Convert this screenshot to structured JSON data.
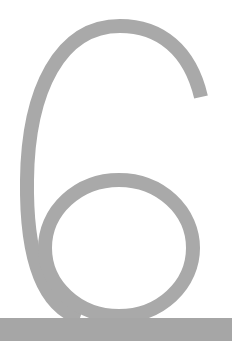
{
  "numeral": {
    "text": "6",
    "color": "#a9a9a9"
  },
  "bar": {
    "color": "#a6a6a6"
  }
}
